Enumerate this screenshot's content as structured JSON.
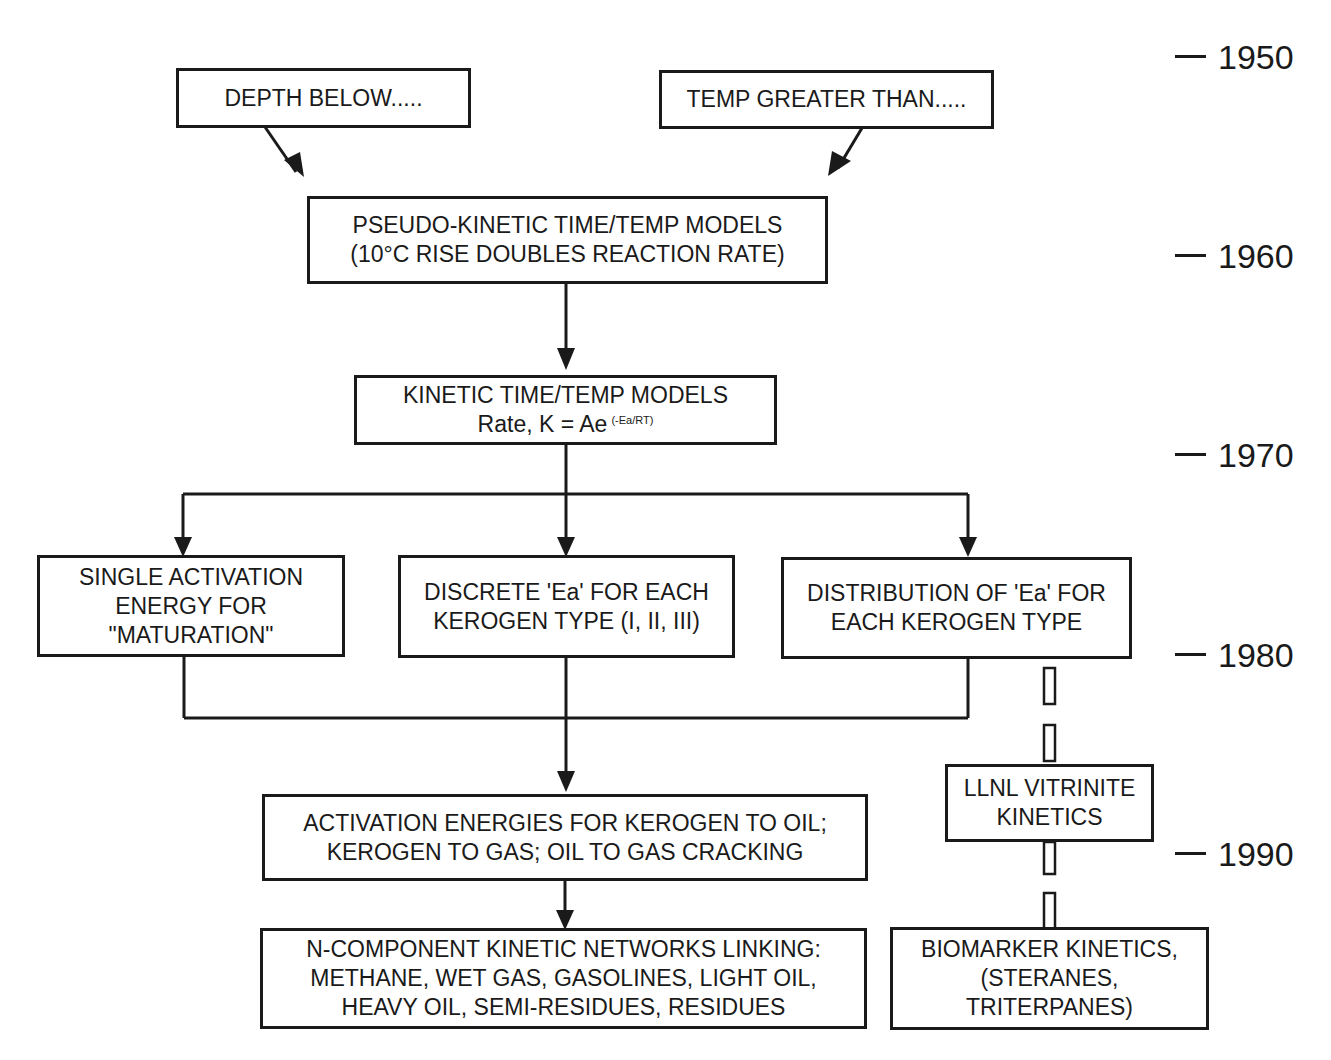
{
  "diagram": {
    "type": "timeline-flowchart",
    "topic": "Evolution of petroleum generation kinetic models",
    "nodes": {
      "depth_below": {
        "lines": [
          "DEPTH BELOW....."
        ]
      },
      "temp_greater": {
        "lines": [
          "TEMP GREATER THAN....."
        ]
      },
      "pseudo_kinetic": {
        "lines": [
          "PSEUDO-KINETIC TIME/TEMP MODELS",
          "(10°C RISE DOUBLES REACTION RATE)"
        ]
      },
      "kinetic": {
        "line1": "KINETIC TIME/TEMP MODELS",
        "line2_base": "Rate, K = Ae",
        "line2_exponent": "(-Ea/RT)"
      },
      "single_activation": {
        "lines": [
          "SINGLE ACTIVATION",
          "ENERGY FOR",
          "\"MATURATION\""
        ]
      },
      "discrete_ea": {
        "lines": [
          "DISCRETE 'Ea' FOR EACH",
          "KEROGEN TYPE (I, II, III)"
        ]
      },
      "distribution_ea": {
        "lines": [
          "DISTRIBUTION OF 'Ea' FOR",
          "EACH KEROGEN TYPE"
        ]
      },
      "llnl_vitrinite": {
        "lines": [
          "LLNL VITRINITE",
          "KINETICS"
        ]
      },
      "activation_energies": {
        "lines": [
          "ACTIVATION ENERGIES FOR KEROGEN TO OIL;",
          "KEROGEN TO GAS; OIL TO GAS CRACKING"
        ]
      },
      "n_component": {
        "lines": [
          "N-COMPONENT KINETIC NETWORKS LINKING:",
          "METHANE, WET GAS, GASOLINES, LIGHT OIL,",
          "HEAVY OIL, SEMI-RESIDUES, RESIDUES"
        ]
      },
      "biomarker": {
        "lines": [
          "BIOMARKER KINETICS,",
          "(STERANES,",
          "TRITERPANES)"
        ]
      }
    },
    "edges": [
      {
        "from": "depth_below",
        "to": "pseudo_kinetic",
        "style": "arrow"
      },
      {
        "from": "temp_greater",
        "to": "pseudo_kinetic",
        "style": "arrow"
      },
      {
        "from": "pseudo_kinetic",
        "to": "kinetic",
        "style": "arrow"
      },
      {
        "from": "kinetic",
        "to": "single_activation",
        "style": "arrow"
      },
      {
        "from": "kinetic",
        "to": "discrete_ea",
        "style": "arrow"
      },
      {
        "from": "kinetic",
        "to": "distribution_ea",
        "style": "arrow"
      },
      {
        "from": "single_activation",
        "to": "activation_energies",
        "style": "merge-arrow"
      },
      {
        "from": "discrete_ea",
        "to": "activation_energies",
        "style": "merge-arrow"
      },
      {
        "from": "distribution_ea",
        "to": "activation_energies",
        "style": "merge-arrow"
      },
      {
        "from": "activation_energies",
        "to": "n_component",
        "style": "arrow"
      },
      {
        "from": "distribution_ea",
        "to": "llnl_vitrinite",
        "style": "dashed-bar"
      },
      {
        "from": "llnl_vitrinite",
        "to": "biomarker",
        "style": "dashed-bar"
      }
    ],
    "timeline": {
      "years": [
        "1950",
        "1960",
        "1970",
        "1980",
        "1990"
      ]
    }
  }
}
